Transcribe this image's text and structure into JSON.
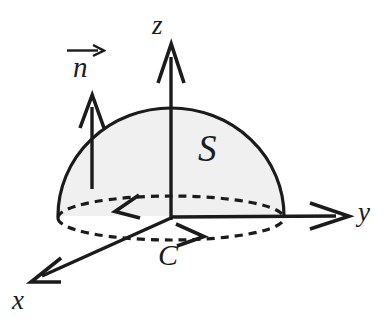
{
  "figure": {
    "kind": "3d-vector-calculus-diagram",
    "background_color": "#ffffff",
    "stroke_color": "#1b1b1b",
    "surface_fill_color": "#f0f0f0",
    "axes": [
      {
        "name": "z",
        "label": "z",
        "direction": "up",
        "tip": [
          171,
          45
        ],
        "origin": [
          171,
          218
        ]
      },
      {
        "name": "y",
        "label": "y",
        "direction": "right",
        "tip": [
          348,
          216
        ],
        "origin": [
          171,
          217
        ]
      },
      {
        "name": "x",
        "label": "x",
        "direction": "down-left",
        "tip": [
          33,
          281
        ],
        "origin": [
          171,
          218
        ]
      }
    ],
    "labels": {
      "z_axis": "z",
      "y_axis": "y",
      "x_axis": "x",
      "surface": "S",
      "curve": "C",
      "normal": "n"
    },
    "surface": {
      "id": "S",
      "shape": "hemisphere-dome",
      "center": [
        171,
        216
      ],
      "radius_x": 113,
      "radius_y": 108,
      "fill": "#f0f0f0",
      "label": "S"
    },
    "boundary_curve": {
      "id": "C",
      "shape": "ellipse",
      "style": "dashed",
      "center": [
        171,
        222
      ],
      "radius_x": 113,
      "radius_y": 22,
      "orientation": "counterclockwise-viewed-from-above",
      "label": "C",
      "arrow_back_direction": "left",
      "arrow_front_direction": "right"
    },
    "normal_vector": {
      "id": "n",
      "label": "n",
      "notation": "over-right-arrow",
      "tail": [
        92,
        188
      ],
      "tip": [
        92,
        96
      ],
      "direction": "up"
    }
  }
}
